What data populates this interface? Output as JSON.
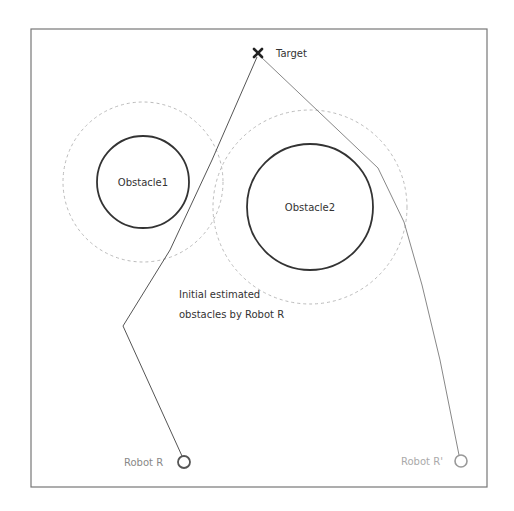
{
  "diagram": {
    "frame": {
      "x": 31,
      "y": 29,
      "width": 456,
      "height": 458,
      "stroke": "#777777"
    },
    "target": {
      "label": "Target",
      "marker": "x-mark-icon",
      "x": 258,
      "y": 53
    },
    "obstacles": [
      {
        "label": "Obstacle1",
        "cx": 143,
        "cy": 182,
        "r": 46,
        "estimated_r": 80,
        "stroke": "#333333",
        "estimated_stroke": "#bbbbbb"
      },
      {
        "label": "Obstacle2",
        "cx": 310,
        "cy": 207,
        "r": 63,
        "estimated_r": 97,
        "stroke": "#333333",
        "estimated_stroke": "#bbbbbb"
      }
    ],
    "annotation": {
      "line1": "Initial estimated",
      "line2": "obstacles by Robot R"
    },
    "robots": [
      {
        "label": "Robot R",
        "cx": 184,
        "cy": 462,
        "r": 6,
        "stroke": "#555555"
      },
      {
        "label": "Robot R'",
        "cx": 461,
        "cy": 461,
        "r": 6,
        "stroke": "#888888"
      }
    ],
    "paths": [
      {
        "name": "robot-r-path",
        "points": "257,57 212,160 170,250 123,326 182,456",
        "stroke": "#555555"
      },
      {
        "name": "robot-r-prime-path",
        "points": "260,56 378,168 404,222 422,285 440,360 459,455",
        "stroke": "#888888"
      }
    ]
  }
}
